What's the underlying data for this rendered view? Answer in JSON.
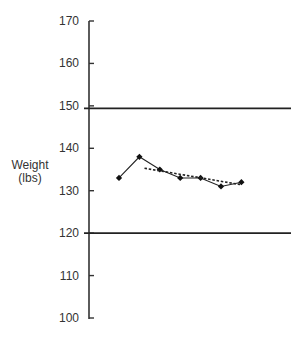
{
  "chart_data": {
    "type": "line",
    "title": "",
    "xlabel": "",
    "ylabel": "Weight (lbs)",
    "ylabel_lines": [
      "Weight",
      "(lbs)"
    ],
    "ylim": [
      100,
      170
    ],
    "yticks": [
      100,
      110,
      120,
      130,
      140,
      150,
      160,
      170
    ],
    "grid": false,
    "legend": null,
    "x": [
      1,
      2,
      3,
      4,
      5,
      6,
      7
    ],
    "series": [
      {
        "name": "Weight",
        "style": "solid-with-markers",
        "values": [
          133,
          138,
          135,
          133,
          133,
          131,
          132
        ]
      },
      {
        "name": "Trend",
        "style": "dotted",
        "x": [
          2.25,
          7
        ],
        "values": [
          135.3,
          131.4
        ]
      }
    ],
    "reference_lines": [
      {
        "name": "Upper limit",
        "value": 149.4
      },
      {
        "name": "Lower limit",
        "value": 120
      }
    ]
  },
  "colors": {
    "axis": "#333333",
    "line": "#222222",
    "marker": "#111111",
    "reference": "#222222"
  }
}
